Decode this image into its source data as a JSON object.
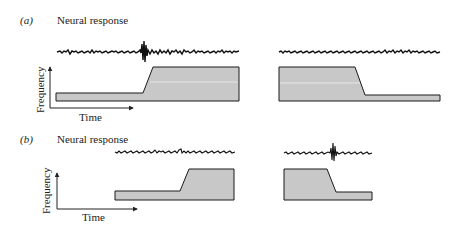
{
  "figure": {
    "panels": [
      {
        "tag": "(a)",
        "title": "Neural response",
        "y_axis_label": "Frequency",
        "x_axis_label": "Time",
        "left_stimulus": "frequency step up (low to high)",
        "right_stimulus": "frequency step down (high to low)",
        "left_response": "burst at onset of upward sweep",
        "right_response": "no burst"
      },
      {
        "tag": "(b)",
        "title": "Neural response",
        "y_axis_label": "Frequency",
        "x_axis_label": "Time",
        "left_stimulus": "frequency step up (low to high)",
        "right_stimulus": "frequency step down (high to low)",
        "left_response": "no burst",
        "right_response": "burst at onset of downward sweep"
      }
    ],
    "colors": {
      "fill": "#c8c8c8",
      "stroke": "#1a1a1a",
      "trace": "#111111",
      "highlight": "#eeeeee"
    }
  }
}
